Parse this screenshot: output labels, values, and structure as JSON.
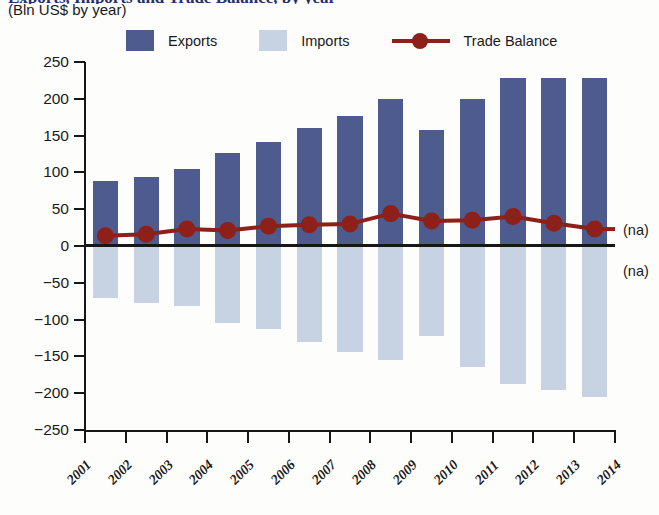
{
  "header": {
    "title_clipped": "Exports, Imports and Trade Balance, by year",
    "subtitle": "(Bln US$ by year)"
  },
  "legend": {
    "items": [
      {
        "label": "Exports",
        "type": "swatch",
        "color": "#4e5b8e"
      },
      {
        "label": "Imports",
        "type": "swatch",
        "color": "#c7d3e3"
      },
      {
        "label": "Trade Balance",
        "type": "line",
        "color": "#8d2018"
      }
    ]
  },
  "annotations": {
    "na_above_axis": "(na)",
    "na_below_axis": "(na)"
  },
  "chart_data": {
    "type": "bar",
    "title": "Exports, Imports and Trade Balance, by year",
    "subtitle": "(Bln US$ by year)",
    "xlabel": "",
    "ylabel": "Bln US$ by year",
    "ylim": [
      -250,
      250
    ],
    "ytick_labels": [
      "250",
      "200",
      "150",
      "100",
      "50",
      "0",
      "−50",
      "−100",
      "−150",
      "−200",
      "−250"
    ],
    "ytick_values": [
      250,
      200,
      150,
      100,
      50,
      0,
      -50,
      -100,
      -150,
      -200,
      -250
    ],
    "grid": false,
    "legend_position": "top",
    "categories": [
      "2001",
      "2002",
      "2003",
      "2004",
      "2005",
      "2006",
      "2007",
      "2008",
      "2009",
      "2010",
      "2011",
      "2012",
      "2013",
      "2014"
    ],
    "series": [
      {
        "name": "Exports",
        "type": "bar",
        "color": "#4e5b8e",
        "values": [
          88,
          94,
          104,
          126,
          141,
          160,
          176,
          200,
          157,
          200,
          228,
          228,
          228,
          null
        ]
      },
      {
        "name": "Imports",
        "type": "bar",
        "color": "#c7d3e3",
        "values": [
          -71,
          -78,
          -82,
          -104,
          -113,
          -130,
          -144,
          -155,
          -122,
          -164,
          -188,
          -196,
          -205,
          null
        ]
      },
      {
        "name": "Trade Balance",
        "type": "line",
        "color": "#8d2018",
        "values": [
          14,
          16,
          23,
          21,
          27,
          29,
          30,
          44,
          34,
          35,
          40,
          31,
          23,
          null
        ]
      }
    ]
  }
}
